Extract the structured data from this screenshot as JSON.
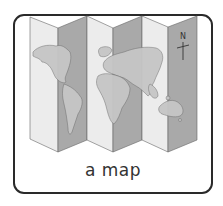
{
  "card": {
    "caption": "a map",
    "compass_label": "N"
  },
  "illustration": {
    "subject": "folded world map",
    "panels": 6,
    "colors": {
      "light_panel": "#ececec",
      "dark_panel": "#a9a9a9",
      "land_on_light": "#c9c9c9",
      "land_on_dark": "#bcbcbc",
      "outline": "#555555",
      "border": "#2a2a2a"
    }
  }
}
